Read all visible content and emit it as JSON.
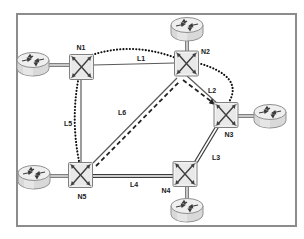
{
  "labels": {
    "n1": "N1",
    "n2": "N2",
    "n3": "N3",
    "n4": "N4",
    "n5": "N5",
    "l1": "L1",
    "l2": "L2",
    "l3": "L3",
    "l4": "L4",
    "l5": "L5",
    "l6": "L6"
  },
  "figure": {
    "background": "#ffffff",
    "frame_border_color": "#8c8c8c",
    "line_color": "#444444",
    "icon_fill": "#e9e9e9",
    "icon_stroke": "#808080"
  },
  "topology": {
    "type": "network-topology",
    "switches": [
      "N1",
      "N2",
      "N3",
      "N4",
      "N5"
    ],
    "routers": [
      {
        "attached_to": "N1",
        "side": "left"
      },
      {
        "attached_to": "N2",
        "side": "top"
      },
      {
        "attached_to": "N3",
        "side": "right"
      },
      {
        "attached_to": "N4",
        "side": "bottom"
      },
      {
        "attached_to": "N5",
        "side": "left"
      }
    ],
    "links": [
      {
        "label": "L1",
        "from": "N1",
        "to": "N2",
        "style": "thin-solid"
      },
      {
        "label": "L2",
        "from": "N2",
        "to": "N3",
        "style": "thin-solid"
      },
      {
        "label": "L3",
        "from": "N3",
        "to": "N4",
        "style": "double-solid"
      },
      {
        "label": "L4",
        "from": "N5",
        "to": "N4",
        "style": "double-solid"
      },
      {
        "label": "L5",
        "from": "N1",
        "to": "N5",
        "style": "thin-solid"
      },
      {
        "label": "L6",
        "from": "N5",
        "to": "N2",
        "style": "thin-solid"
      }
    ],
    "overlay_paths": [
      {
        "style": "dotted",
        "route": [
          "N5",
          "N1",
          "N2",
          "N3"
        ]
      },
      {
        "style": "dashed",
        "route": [
          "N5",
          "N2",
          "N3"
        ],
        "arrowhead_at": "N3"
      }
    ]
  }
}
